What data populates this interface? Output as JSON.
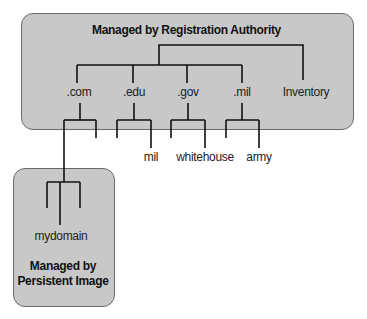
{
  "registry_box": {
    "title": "Managed by Registration Authority",
    "root_children": [
      ".com",
      ".edu",
      ".gov",
      ".mil",
      "Inventory"
    ]
  },
  "leaves": {
    "edu_child": "mil",
    "gov_child": "whitehouse",
    "mil_child": "army"
  },
  "persistent_box": {
    "domain": "mydomain",
    "title_line1": "Managed by",
    "title_line2": "Persistent Image"
  },
  "colors": {
    "box_fill": "#c8c8c8",
    "line": "#111111"
  }
}
